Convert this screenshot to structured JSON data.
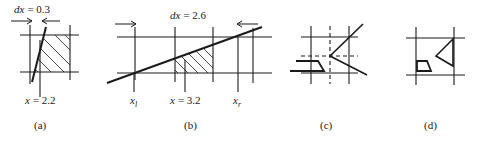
{
  "figure": {
    "panels": [
      {
        "id": "a",
        "caption": "(a)",
        "top_label": "dx = 0.3",
        "top_label_var": "dx",
        "top_label_value": "= 0.3",
        "bottom_label_var": "x",
        "bottom_label_value": "= 2.2"
      },
      {
        "id": "b",
        "caption": "(b)",
        "top_label_var": "dx",
        "top_label_value": "= 2.6",
        "bottom_labels": [
          {
            "var": "x",
            "sub": "l"
          },
          {
            "var": "x",
            "value": "= 3.2"
          },
          {
            "var": "x",
            "sub": "r"
          }
        ]
      },
      {
        "id": "c",
        "caption": "(c)"
      },
      {
        "id": "d",
        "caption": "(d)"
      }
    ]
  }
}
